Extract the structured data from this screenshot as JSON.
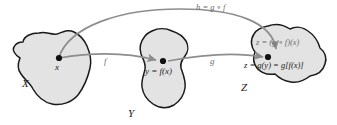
{
  "figure": {
    "type": "function-composition-diagram",
    "colors": {
      "blob_fill": "#e3e3e3",
      "blob_stroke": "#1a1a1a",
      "arrow": "#8d8d8d",
      "text": "#1a1a1a",
      "muted_text": "#6f6f6f",
      "background": "#ffffff"
    },
    "sets": [
      {
        "id": "X",
        "label": "X"
      },
      {
        "id": "Y",
        "label": "Y"
      },
      {
        "id": "Z",
        "label": "Z"
      }
    ],
    "points": [
      {
        "id": "x",
        "label": "x",
        "set": "X"
      },
      {
        "id": "y",
        "label": "y = f(x)",
        "set": "Y"
      },
      {
        "id": "z",
        "label": "z = g(y) = g[f(x)]",
        "set": "Z"
      }
    ],
    "maps": [
      {
        "id": "f",
        "label": "f",
        "from": "X",
        "to": "Y"
      },
      {
        "id": "g",
        "label": "g",
        "from": "Y",
        "to": "Z"
      },
      {
        "id": "h",
        "label": "h = g ∘ f",
        "from": "X",
        "to": "Z"
      }
    ],
    "annotations": [
      {
        "id": "z-composite",
        "label": "z = (g ∘ f)(x)"
      }
    ]
  }
}
